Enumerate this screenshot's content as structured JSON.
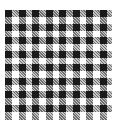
{
  "image": {
    "subject": "gingham check fabric swatch",
    "pattern": "black and white gingham",
    "grid": {
      "columns": 8,
      "rows": 8,
      "pitch_px": 13.5,
      "band_px": 7
    },
    "colors": {
      "background": "#ffffff",
      "dark": "#1a1a1a",
      "mid": "#777777"
    }
  }
}
